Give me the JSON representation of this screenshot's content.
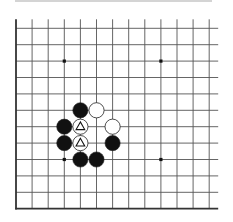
{
  "diagram": {
    "type": "go-board-fragment",
    "corner": "bottom-left",
    "columns": 13,
    "rows": 12,
    "origin_x": 16,
    "origin_y": 28.3,
    "spacing_x": 16.1,
    "spacing_y": 16.4,
    "stone_radius": 7.6,
    "colors": {
      "line": "#555555",
      "edge": "#333333",
      "black_stone": "#111111",
      "white_stone": "#ffffff",
      "stone_outline": "#222222",
      "top_rule": "#aaaaaa"
    },
    "star_points": [
      {
        "col": 3,
        "row": 2
      },
      {
        "col": 9,
        "row": 2
      },
      {
        "col": 3,
        "row": 8
      },
      {
        "col": 9,
        "row": 8
      }
    ],
    "stones": [
      {
        "color": "black",
        "col": 4,
        "row": 5,
        "marker": ""
      },
      {
        "color": "white",
        "col": 5,
        "row": 5,
        "marker": ""
      },
      {
        "color": "black",
        "col": 3,
        "row": 6,
        "marker": ""
      },
      {
        "color": "white",
        "col": 4,
        "row": 6,
        "marker": "triangle"
      },
      {
        "color": "white",
        "col": 6,
        "row": 6,
        "marker": ""
      },
      {
        "color": "black",
        "col": 3,
        "row": 7,
        "marker": ""
      },
      {
        "color": "white",
        "col": 4,
        "row": 7,
        "marker": "triangle"
      },
      {
        "color": "black",
        "col": 6,
        "row": 7,
        "marker": ""
      },
      {
        "color": "black",
        "col": 4,
        "row": 8,
        "marker": ""
      },
      {
        "color": "black",
        "col": 5,
        "row": 8,
        "marker": ""
      }
    ]
  }
}
